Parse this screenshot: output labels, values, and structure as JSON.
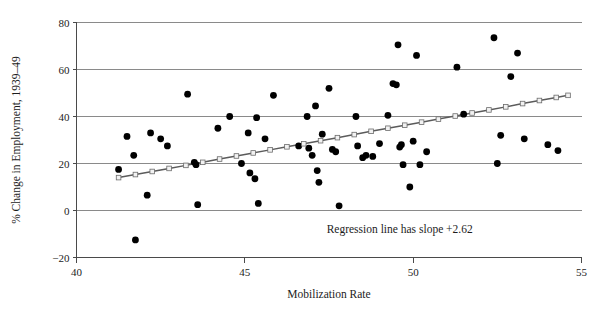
{
  "chart_data": {
    "type": "scatter",
    "title": "",
    "xlabel": "Mobilization Rate",
    "ylabel": "% Change in Employment, 1939–49",
    "xlim": [
      40,
      55
    ],
    "ylim": [
      -20,
      80
    ],
    "xticks": [
      40,
      45,
      50,
      55
    ],
    "yticks": [
      -20,
      0,
      20,
      40,
      60,
      80
    ],
    "xtick_labels": [
      "40",
      "45",
      "50",
      "55"
    ],
    "ytick_labels": [
      "−20",
      "0",
      "20",
      "40",
      "60",
      "80"
    ],
    "grid": "horizontal",
    "legend": "none",
    "annotations": [
      {
        "text": "Regression line has slope +2.62",
        "x": 49.6,
        "y": -9.5
      }
    ],
    "series": [
      {
        "name": "States",
        "type": "scatter",
        "marker": "filled-circle",
        "color": "#000000",
        "points": [
          [
            41.25,
            17.5
          ],
          [
            41.5,
            31.5
          ],
          [
            41.7,
            23.5
          ],
          [
            41.75,
            -12.5
          ],
          [
            42.1,
            6.5
          ],
          [
            42.2,
            33.0
          ],
          [
            42.5,
            30.5
          ],
          [
            42.7,
            27.5
          ],
          [
            43.3,
            49.5
          ],
          [
            43.5,
            20.5
          ],
          [
            43.55,
            19.5
          ],
          [
            43.6,
            2.5
          ],
          [
            44.2,
            35.0
          ],
          [
            44.55,
            40.0
          ],
          [
            44.9,
            20.0
          ],
          [
            45.1,
            33.0
          ],
          [
            45.15,
            16.0
          ],
          [
            45.3,
            13.5
          ],
          [
            45.35,
            39.5
          ],
          [
            45.4,
            3.0
          ],
          [
            45.6,
            30.5
          ],
          [
            45.85,
            49.0
          ],
          [
            46.6,
            27.5
          ],
          [
            46.85,
            40.0
          ],
          [
            46.9,
            26.5
          ],
          [
            47.0,
            23.5
          ],
          [
            47.1,
            44.5
          ],
          [
            47.15,
            17.0
          ],
          [
            47.2,
            12.0
          ],
          [
            47.3,
            32.5
          ],
          [
            47.5,
            52.0
          ],
          [
            47.6,
            26.0
          ],
          [
            47.7,
            25.0
          ],
          [
            47.8,
            2.0
          ],
          [
            48.3,
            40.0
          ],
          [
            48.35,
            27.5
          ],
          [
            48.5,
            22.5
          ],
          [
            48.6,
            23.5
          ],
          [
            48.8,
            23.0
          ],
          [
            49.0,
            28.5
          ],
          [
            49.25,
            40.5
          ],
          [
            49.4,
            54.0
          ],
          [
            49.5,
            53.5
          ],
          [
            49.55,
            70.5
          ],
          [
            49.6,
            27.0
          ],
          [
            49.65,
            28.0
          ],
          [
            49.7,
            19.5
          ],
          [
            49.9,
            10.0
          ],
          [
            50.0,
            29.5
          ],
          [
            50.1,
            66.0
          ],
          [
            50.2,
            19.5
          ],
          [
            50.4,
            25.0
          ],
          [
            51.3,
            61.0
          ],
          [
            51.5,
            41.0
          ],
          [
            52.4,
            73.5
          ],
          [
            52.5,
            20.0
          ],
          [
            52.6,
            32.0
          ],
          [
            52.9,
            57.0
          ],
          [
            53.1,
            67.0
          ],
          [
            53.3,
            30.5
          ],
          [
            54.0,
            28.0
          ],
          [
            54.3,
            25.5
          ]
        ]
      },
      {
        "name": "Regression line",
        "type": "line",
        "marker": "open-square",
        "color": "#5b5b5b",
        "slope": 2.62,
        "points": [
          [
            41.25,
            14.0
          ],
          [
            41.75,
            15.3
          ],
          [
            42.25,
            16.6
          ],
          [
            42.75,
            17.9
          ],
          [
            43.25,
            19.2
          ],
          [
            43.75,
            20.5
          ],
          [
            44.25,
            21.9
          ],
          [
            44.75,
            23.2
          ],
          [
            45.25,
            24.5
          ],
          [
            45.75,
            25.8
          ],
          [
            46.25,
            27.1
          ],
          [
            46.75,
            28.4
          ],
          [
            47.25,
            29.7
          ],
          [
            47.75,
            31.0
          ],
          [
            48.25,
            32.3
          ],
          [
            48.75,
            33.7
          ],
          [
            49.25,
            35.0
          ],
          [
            49.75,
            36.3
          ],
          [
            50.25,
            37.6
          ],
          [
            50.75,
            38.9
          ],
          [
            51.25,
            40.2
          ],
          [
            51.75,
            41.5
          ],
          [
            52.25,
            42.8
          ],
          [
            52.75,
            44.1
          ],
          [
            53.25,
            45.5
          ],
          [
            53.75,
            46.8
          ],
          [
            54.25,
            48.1
          ],
          [
            54.6,
            49.0
          ]
        ]
      }
    ]
  }
}
